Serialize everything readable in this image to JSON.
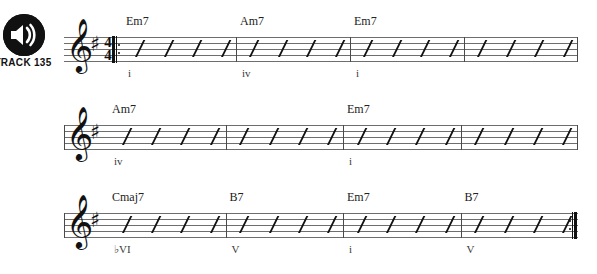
{
  "track": {
    "label": "TRACK 135",
    "icon": "speaker-icon"
  },
  "score": {
    "clef": "\u0001d11e",
    "clef_glyph": "𝄞",
    "key_signature_glyph": "♯",
    "time_signature": {
      "numerator": "4",
      "denominator": "4"
    },
    "key": "one sharp",
    "systems": [
      {
        "start_barline": "repeat-start",
        "end_barline": "plain",
        "has_time_signature": true,
        "measures": [
          {
            "chord": "Em7",
            "roman": "i",
            "beats": 4
          },
          {
            "chord": "Am7",
            "roman": "iv",
            "beats": 4
          },
          {
            "chord": "Em7",
            "roman": "i",
            "beats": 4
          },
          {
            "chord": "",
            "roman": "",
            "beats": 4
          }
        ]
      },
      {
        "start_barline": "plain",
        "end_barline": "plain",
        "has_time_signature": false,
        "measures": [
          {
            "chord": "Am7",
            "roman": "iv",
            "beats": 4
          },
          {
            "chord": "",
            "roman": "",
            "beats": 4
          },
          {
            "chord": "Em7",
            "roman": "i",
            "beats": 4
          },
          {
            "chord": "",
            "roman": "",
            "beats": 4
          }
        ]
      },
      {
        "start_barline": "plain",
        "end_barline": "repeat-end",
        "has_time_signature": false,
        "measures": [
          {
            "chord": "Cmaj7",
            "roman": "♭VI",
            "beats": 4
          },
          {
            "chord": "B7",
            "roman": "V",
            "beats": 4
          },
          {
            "chord": "Em7",
            "roman": "i",
            "beats": 4
          },
          {
            "chord": "B7",
            "roman": "V",
            "beats": 4
          }
        ]
      }
    ]
  },
  "colors": {
    "ink": "#111111",
    "staff_line": "#6e6e6e",
    "text": "#222222"
  }
}
